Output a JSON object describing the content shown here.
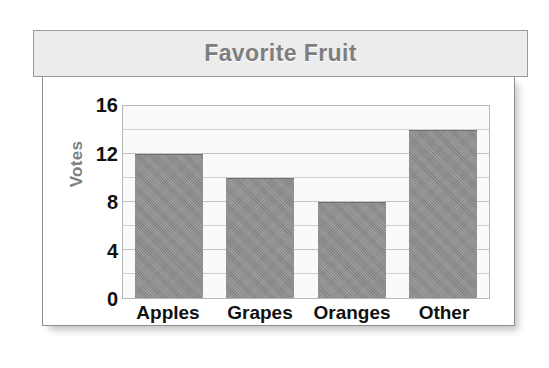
{
  "chart_data": {
    "type": "bar",
    "title": "Favorite Fruit",
    "xlabel": "",
    "ylabel": "Votes",
    "categories": [
      "Apples",
      "Grapes",
      "Oranges",
      "Other"
    ],
    "values": [
      12,
      10,
      8,
      14
    ],
    "ylim": [
      0,
      16
    ],
    "ytick_labels": [
      "0",
      "4",
      "8",
      "12",
      "16"
    ],
    "ytick_values": [
      0,
      4,
      8,
      12,
      16
    ],
    "gridlines": {
      "orientation": "horizontal",
      "major_step": 4,
      "minor_step": 2,
      "values": [
        2,
        4,
        6,
        8,
        10,
        12,
        14
      ],
      "visible": true
    },
    "legend": {
      "visible": false
    },
    "colors": {
      "bar_fill": "#8b8b8b",
      "bar_edge": "#707070",
      "plot_background": "#fafafa",
      "plot_border": "#b9b9b9",
      "gridline": "#cfcfcf",
      "title_text": "#7e7e7e",
      "title_band_background": "#ececec",
      "title_band_border": "#9a9a9a",
      "axis_label_text": "#808080",
      "tick_text": "#111111",
      "card_background": "#ffffff",
      "card_border": "#8f8f8f"
    }
  }
}
